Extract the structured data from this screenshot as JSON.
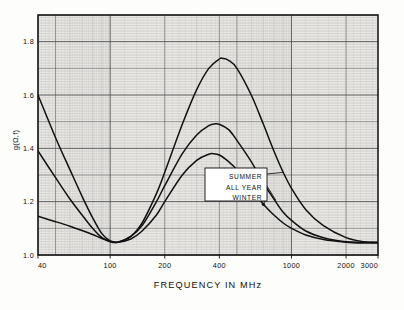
{
  "figure": {
    "y_axis_title": "g(Ω,f)",
    "x_axis_title": "FREQUENCY  IN   MHz",
    "y_ticks": [
      "1.0",
      "1.2",
      "1.4",
      "1.6",
      "1.8"
    ],
    "x_ticks": [
      "40",
      "100",
      "200",
      "400",
      "1000",
      "2000",
      "3000"
    ],
    "legend": {
      "items": [
        "SUMMER",
        "ALL YEAR",
        "WINTER"
      ]
    },
    "colors": {
      "ink": "#111111",
      "grid_major": "#5a5a5a",
      "grid_minor": "#9a9a9a",
      "paper": "#fdfdfb"
    }
  },
  "chart_data": {
    "type": "line",
    "title": "",
    "subtitle": "",
    "xlabel": "FREQUENCY  IN   MHz",
    "ylabel": "g(Ω,f)",
    "xscale": "log",
    "yscale": "linear",
    "xlim": [
      40,
      3000
    ],
    "ylim": [
      1.0,
      1.9
    ],
    "xticks": [
      40,
      100,
      200,
      400,
      1000,
      2000,
      3000
    ],
    "yticks": [
      1.0,
      1.2,
      1.4,
      1.6,
      1.8
    ],
    "grid": "semi-log graph paper, major and minor decade rulings",
    "legend_position": "center-right inside plot, boxed with leader lines",
    "annotations": [
      "SUMMER",
      "ALL YEAR",
      "WINTER"
    ],
    "series": [
      {
        "name": "SUMMER",
        "x": [
          40,
          50,
          60,
          70,
          80,
          90,
          100,
          110,
          130,
          150,
          180,
          200,
          250,
          300,
          350,
          400,
          420,
          450,
          500,
          600,
          700,
          800,
          900,
          1000,
          1200,
          1500,
          2000,
          2500,
          3000
        ],
        "values": [
          1.6,
          1.44,
          1.32,
          1.22,
          1.14,
          1.08,
          1.053,
          1.048,
          1.07,
          1.12,
          1.23,
          1.31,
          1.49,
          1.62,
          1.7,
          1.735,
          1.737,
          1.73,
          1.7,
          1.6,
          1.49,
          1.39,
          1.31,
          1.25,
          1.17,
          1.11,
          1.065,
          1.05,
          1.048
        ]
      },
      {
        "name": "ALL YEAR",
        "x": [
          40,
          50,
          60,
          70,
          80,
          90,
          100,
          110,
          130,
          150,
          180,
          200,
          250,
          300,
          350,
          380,
          400,
          450,
          500,
          600,
          700,
          800,
          900,
          1000,
          1200,
          1500,
          2000,
          2500,
          3000
        ],
        "values": [
          1.39,
          1.29,
          1.21,
          1.15,
          1.1,
          1.065,
          1.05,
          1.048,
          1.07,
          1.11,
          1.2,
          1.26,
          1.38,
          1.45,
          1.485,
          1.492,
          1.49,
          1.47,
          1.43,
          1.35,
          1.27,
          1.21,
          1.16,
          1.13,
          1.09,
          1.065,
          1.05,
          1.048,
          1.047
        ]
      },
      {
        "name": "WINTER",
        "x": [
          40,
          50,
          60,
          70,
          80,
          90,
          100,
          110,
          130,
          150,
          180,
          200,
          250,
          300,
          350,
          370,
          400,
          450,
          500,
          600,
          700,
          800,
          900,
          1000,
          1200,
          1500,
          2000,
          2500,
          3000
        ],
        "values": [
          1.145,
          1.125,
          1.108,
          1.092,
          1.077,
          1.062,
          1.052,
          1.048,
          1.06,
          1.09,
          1.15,
          1.2,
          1.3,
          1.355,
          1.378,
          1.38,
          1.375,
          1.35,
          1.32,
          1.25,
          1.19,
          1.15,
          1.12,
          1.1,
          1.075,
          1.058,
          1.048,
          1.045,
          1.045
        ]
      }
    ]
  }
}
